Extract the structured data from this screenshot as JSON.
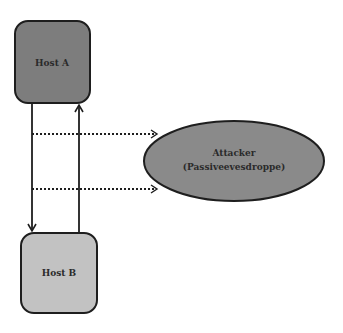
{
  "diagram": {
    "nodes": {
      "host_a": {
        "label": "Host A",
        "fill": "#7d7d7d"
      },
      "host_b": {
        "label": "Host B",
        "fill": "#c2c2c2"
      },
      "attacker": {
        "line1": "Attacker",
        "line2": "(Passiveevesdroppe)",
        "fill": "#8a8a8a"
      }
    },
    "edges": [
      {
        "from": "Host A",
        "to": "Host B",
        "style": "solid"
      },
      {
        "from": "Host B",
        "to": "Host A",
        "style": "solid"
      },
      {
        "from": "A-to-B link",
        "to": "Attacker",
        "style": "dotted"
      },
      {
        "from": "A-to-B link",
        "to": "Attacker",
        "style": "dotted"
      }
    ],
    "stroke_color": "#1e1e1e"
  }
}
